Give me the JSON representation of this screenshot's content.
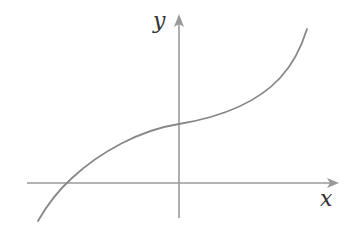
{
  "diagram": {
    "type": "function-graph",
    "axes": {
      "x_label": "x",
      "y_label": "y",
      "axis_color": "#9a9a9a",
      "origin_px": [
        179,
        183
      ]
    },
    "curve": {
      "color": "#888888",
      "x_intercept": "negative x",
      "y_intercept": "positive y",
      "behavior": "monotonically increasing, concave down left of y-axis, concave up right of y-axis"
    }
  }
}
